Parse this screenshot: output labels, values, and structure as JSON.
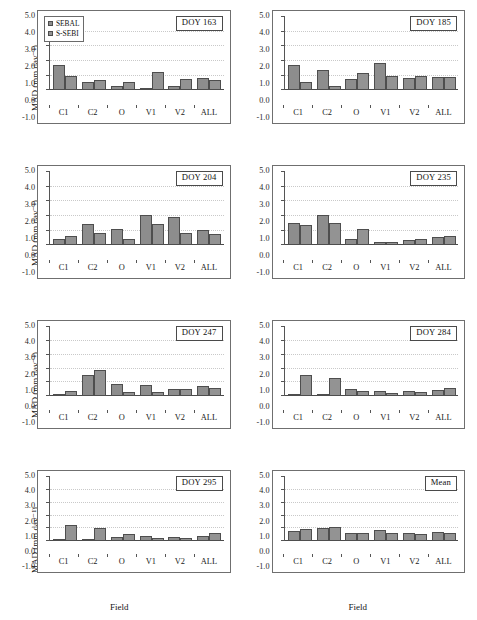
{
  "figure": {
    "xlabel": "Field",
    "ylabel": "MAD (mm day⁻¹)",
    "categories": [
      "C1",
      "C2",
      "O",
      "V1",
      "V2",
      "ALL"
    ],
    "yticks": [
      "5.0",
      "4.0",
      "3.0",
      "2.0",
      "1.0",
      "0.0",
      "-1.0"
    ],
    "ylim": [
      -1.0,
      5.0
    ],
    "gridlines": [
      1.0,
      2.0,
      3.0,
      4.0
    ],
    "legend": {
      "position": "top-left of first panel",
      "entries": [
        {
          "label": "SEBAL",
          "color": "#8d8d8d"
        },
        {
          "label": "S-SEBI",
          "color": "#939393"
        }
      ]
    }
  },
  "chart_data": [
    {
      "type": "bar",
      "title": "DOY 163",
      "xlabel": "Field",
      "ylabel": "MAD (mm day⁻¹)",
      "ylim": [
        -1.0,
        5.0
      ],
      "categories": [
        "C1",
        "C2",
        "O",
        "V1",
        "V2",
        "ALL"
      ],
      "series": [
        {
          "name": "SEBAL",
          "values": [
            1.7,
            0.6,
            0.28,
            0.1,
            0.28,
            0.85
          ]
        },
        {
          "name": "S-SEBI",
          "values": [
            1.0,
            0.7,
            0.55,
            1.25,
            0.8,
            0.68
          ]
        }
      ]
    },
    {
      "type": "bar",
      "title": "DOY 185",
      "xlabel": "Field",
      "ylabel": "MAD (mm day⁻¹)",
      "ylim": [
        -1.0,
        5.0
      ],
      "categories": [
        "C1",
        "C2",
        "O",
        "V1",
        "V2",
        "ALL"
      ],
      "series": [
        {
          "name": "SEBAL",
          "values": [
            1.75,
            1.4,
            0.8,
            1.85,
            0.85,
            0.9
          ]
        },
        {
          "name": "S-SEBI",
          "values": [
            0.55,
            0.3,
            1.15,
            0.95,
            1.0,
            0.9
          ]
        }
      ]
    },
    {
      "type": "bar",
      "title": "DOY 204",
      "xlabel": "Field",
      "ylabel": "MAD (mm day⁻¹)",
      "ylim": [
        -1.0,
        5.0
      ],
      "categories": [
        "C1",
        "C2",
        "O",
        "V1",
        "V2",
        "ALL"
      ],
      "series": [
        {
          "name": "SEBAL",
          "values": [
            0.4,
            1.45,
            1.1,
            2.1,
            1.9,
            1.05
          ]
        },
        {
          "name": "S-SEBI",
          "values": [
            0.65,
            0.85,
            0.4,
            1.45,
            0.85,
            0.8
          ]
        }
      ]
    },
    {
      "type": "bar",
      "title": "DOY 235",
      "xlabel": "Field",
      "ylabel": "MAD (mm day⁻¹)",
      "ylim": [
        -1.0,
        5.0
      ],
      "categories": [
        "C1",
        "C2",
        "O",
        "V1",
        "V2",
        "ALL"
      ],
      "series": [
        {
          "name": "SEBAL",
          "values": [
            1.5,
            2.05,
            0.4,
            0.25,
            0.35,
            0.55
          ]
        },
        {
          "name": "S-SEBI",
          "values": [
            1.4,
            1.55,
            1.1,
            0.2,
            0.4,
            0.65
          ]
        }
      ]
    },
    {
      "type": "bar",
      "title": "DOY 247",
      "xlabel": "Field",
      "ylabel": "MAD (mm day⁻¹)",
      "ylim": [
        -1.0,
        5.0
      ],
      "categories": [
        "C1",
        "C2",
        "O",
        "V1",
        "V2",
        "ALL"
      ],
      "series": [
        {
          "name": "SEBAL",
          "values": [
            0.1,
            1.5,
            0.85,
            0.8,
            0.55,
            0.75
          ]
        },
        {
          "name": "S-SEBI",
          "values": [
            0.4,
            1.9,
            0.3,
            0.3,
            0.55,
            0.6
          ]
        }
      ]
    },
    {
      "type": "bar",
      "title": "DOY 284",
      "xlabel": "Field",
      "ylabel": "MAD (mm day⁻¹)",
      "ylim": [
        -1.0,
        5.0
      ],
      "categories": [
        "C1",
        "C2",
        "O",
        "V1",
        "V2",
        "ALL"
      ],
      "series": [
        {
          "name": "SEBAL",
          "values": [
            0.1,
            0.12,
            0.5,
            0.4,
            0.4,
            0.45
          ]
        },
        {
          "name": "S-SEBI",
          "values": [
            1.5,
            1.35,
            0.4,
            0.25,
            0.3,
            0.6
          ]
        }
      ]
    },
    {
      "type": "bar",
      "title": "DOY 295",
      "xlabel": "Field",
      "ylabel": "MAD (mm day⁻¹)",
      "ylim": [
        -1.0,
        5.0
      ],
      "categories": [
        "C1",
        "C2",
        "O",
        "V1",
        "V2",
        "ALL"
      ],
      "series": [
        {
          "name": "SEBAL",
          "values": [
            0.1,
            0.1,
            0.35,
            0.4,
            0.3,
            0.4
          ]
        },
        {
          "name": "S-SEBI",
          "values": [
            1.25,
            1.05,
            0.55,
            0.25,
            0.25,
            0.65
          ]
        }
      ]
    },
    {
      "type": "bar",
      "title": "Mean",
      "xlabel": "Field",
      "ylabel": "MAD (mm day⁻¹)",
      "ylim": [
        -1.0,
        5.0
      ],
      "categories": [
        "C1",
        "C2",
        "O",
        "V1",
        "V2",
        "ALL"
      ],
      "series": [
        {
          "name": "SEBAL",
          "values": [
            0.8,
            1.05,
            0.6,
            0.85,
            0.6,
            0.7
          ]
        },
        {
          "name": "S-SEBI",
          "values": [
            0.95,
            1.1,
            0.6,
            0.65,
            0.55,
            0.65
          ]
        }
      ]
    }
  ]
}
